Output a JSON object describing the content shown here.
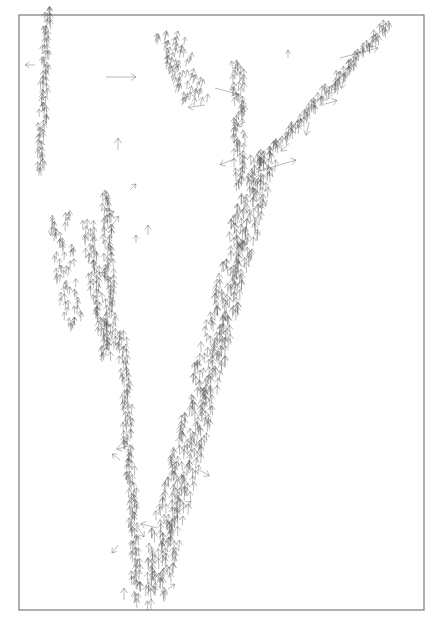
{
  "chart_data": {
    "type": "quiver",
    "title": "",
    "xlabel": "",
    "ylabel": "",
    "grid": false,
    "legend": null,
    "frame": {
      "x0": 19,
      "y0": 15,
      "x1": 424,
      "y1": 610
    },
    "arrow_color": "#555555",
    "frame_color": "#7a7a7a",
    "background": "#ffffff",
    "streams": [
      {
        "name": "top-left-vertical",
        "x0": 48,
        "y0": 15,
        "x1": 40,
        "y1": 175,
        "dx": 0,
        "dy": -9,
        "count": 26,
        "spread": 4
      },
      {
        "name": "left-cluster",
        "x0": 60,
        "y0": 220,
        "x1": 72,
        "y1": 330,
        "dx": 0,
        "dy": -8,
        "count": 22,
        "spread": 10
      },
      {
        "name": "left-vertical-1",
        "x0": 88,
        "y0": 230,
        "x1": 105,
        "y1": 360,
        "dx": 0,
        "dy": -9,
        "count": 24,
        "spread": 6
      },
      {
        "name": "left-vertical-2",
        "x0": 106,
        "y0": 200,
        "x1": 112,
        "y1": 350,
        "dx": 0,
        "dy": -9,
        "count": 28,
        "spread": 5
      },
      {
        "name": "left-lower-vertical",
        "x0": 122,
        "y0": 340,
        "x1": 137,
        "y1": 590,
        "dx": 0,
        "dy": -9,
        "count": 44,
        "spread": 5
      },
      {
        "name": "main-diagonal-a",
        "x0": 142,
        "y0": 608,
        "x1": 258,
        "y1": 160,
        "dx": 0,
        "dy": -10,
        "count": 85,
        "spread": 9
      },
      {
        "name": "main-diagonal-b",
        "x0": 160,
        "y0": 600,
        "x1": 268,
        "y1": 170,
        "dx": 0,
        "dy": -10,
        "count": 80,
        "spread": 7
      },
      {
        "name": "upper-vertical",
        "x0": 238,
        "y0": 70,
        "x1": 240,
        "y1": 190,
        "dx": 0,
        "dy": -9,
        "count": 24,
        "spread": 6
      },
      {
        "name": "right-diagonal",
        "x0": 262,
        "y0": 168,
        "x1": 388,
        "y1": 30,
        "dx": 0,
        "dy": -9,
        "count": 40,
        "spread": 6
      },
      {
        "name": "top-center-cluster",
        "x0": 168,
        "y0": 40,
        "x1": 195,
        "y1": 105,
        "dx": 2,
        "dy": -8,
        "count": 24,
        "spread": 14
      }
    ],
    "isolated_arrows": [
      {
        "x": 106,
        "y": 77,
        "dx": 30,
        "dy": 0
      },
      {
        "x": 118,
        "y": 150,
        "dx": 0,
        "dy": -12
      },
      {
        "x": 130,
        "y": 190,
        "dx": 6,
        "dy": -6
      },
      {
        "x": 148,
        "y": 235,
        "dx": 0,
        "dy": -10
      },
      {
        "x": 136,
        "y": 243,
        "dx": 0,
        "dy": -8
      },
      {
        "x": 288,
        "y": 58,
        "dx": 0,
        "dy": -8
      },
      {
        "x": 215,
        "y": 88,
        "dx": 22,
        "dy": 6
      },
      {
        "x": 124,
        "y": 600,
        "dx": 0,
        "dy": -12
      },
      {
        "x": 35,
        "y": 65,
        "dx": -10,
        "dy": 0
      },
      {
        "x": 256,
        "y": 172,
        "dx": 40,
        "dy": -12
      },
      {
        "x": 340,
        "y": 58,
        "dx": 38,
        "dy": -10
      },
      {
        "x": 120,
        "y": 460,
        "dx": -8,
        "dy": -6
      },
      {
        "x": 118,
        "y": 545,
        "dx": -6,
        "dy": 8
      }
    ]
  }
}
